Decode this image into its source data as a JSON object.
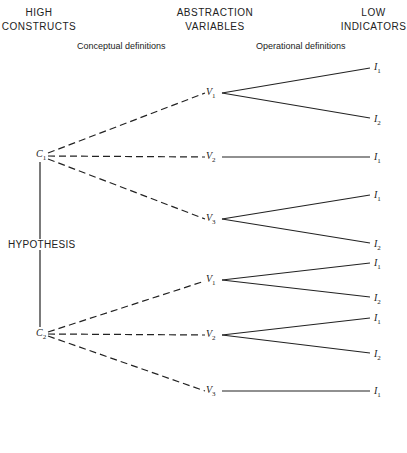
{
  "headers": {
    "high": {
      "line1": "HIGH",
      "line2": "CONSTRUCTS"
    },
    "abstraction": {
      "line1": "ABSTRACTION",
      "line2": "VARIABLES"
    },
    "low": {
      "line1": "LOW",
      "line2": "INDICATORS"
    }
  },
  "subheaders": {
    "conceptual": "Conceptual definitions",
    "operational": "Operational definitions"
  },
  "hypothesis": "HYPOTHESIS",
  "constructs": [
    {
      "name": "C",
      "sub": "1"
    },
    {
      "name": "C",
      "sub": "2"
    }
  ],
  "variables": [
    {
      "name": "V",
      "sub": "1"
    },
    {
      "name": "V",
      "sub": "2"
    },
    {
      "name": "V",
      "sub": "3"
    },
    {
      "name": "V",
      "sub": "1"
    },
    {
      "name": "V",
      "sub": "2"
    },
    {
      "name": "V",
      "sub": "3"
    }
  ],
  "indicators": [
    {
      "name": "I",
      "sub": "1"
    },
    {
      "name": "I",
      "sub": "2"
    },
    {
      "name": "I",
      "sub": "1"
    },
    {
      "name": "I",
      "sub": "1"
    },
    {
      "name": "I",
      "sub": "2"
    },
    {
      "name": "I",
      "sub": "1"
    },
    {
      "name": "I",
      "sub": "2"
    },
    {
      "name": "I",
      "sub": "1"
    },
    {
      "name": "I",
      "sub": "2"
    },
    {
      "name": "I",
      "sub": "1"
    }
  ]
}
